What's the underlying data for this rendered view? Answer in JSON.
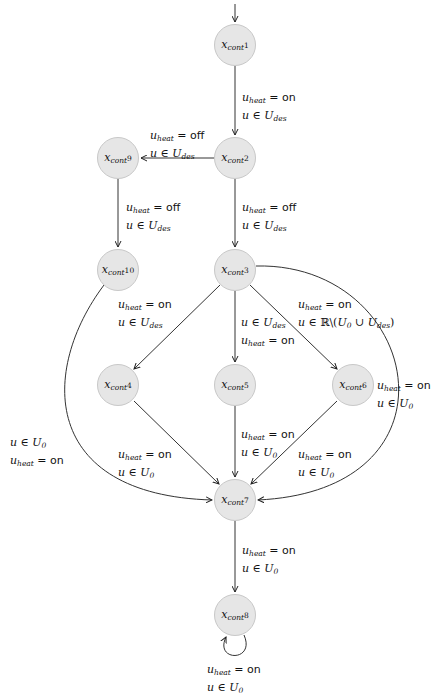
{
  "diagram": {
    "type": "state-transition-graph",
    "entry_arrow": "into x_cont 1",
    "nodes": [
      {
        "id": "x1",
        "var": "x",
        "sub": "cont",
        "index": "1",
        "cx": 235,
        "cy": 45
      },
      {
        "id": "x2",
        "var": "x",
        "sub": "cont",
        "index": "2",
        "cx": 235,
        "cy": 158
      },
      {
        "id": "x9",
        "var": "x",
        "sub": "cont",
        "index": "9",
        "cx": 118,
        "cy": 158
      },
      {
        "id": "x10",
        "var": "x",
        "sub": "cont",
        "index": "10",
        "cx": 118,
        "cy": 270
      },
      {
        "id": "x3",
        "var": "x",
        "sub": "cont",
        "index": "3",
        "cx": 235,
        "cy": 270
      },
      {
        "id": "x4",
        "var": "x",
        "sub": "cont",
        "index": "4",
        "cx": 118,
        "cy": 385
      },
      {
        "id": "x5",
        "var": "x",
        "sub": "cont",
        "index": "5",
        "cx": 235,
        "cy": 385
      },
      {
        "id": "x6",
        "var": "x",
        "sub": "cont",
        "index": "6",
        "cx": 353,
        "cy": 385
      },
      {
        "id": "x7",
        "var": "x",
        "sub": "cont",
        "index": "7",
        "cx": 235,
        "cy": 500
      },
      {
        "id": "x8",
        "var": "x",
        "sub": "cont",
        "index": "8",
        "cx": 235,
        "cy": 615
      }
    ],
    "edges": [
      {
        "from": "x1",
        "to": "x2",
        "heat": "on",
        "set": "U_des"
      },
      {
        "from": "x2",
        "to": "x9",
        "heat": "off",
        "set": "U_des"
      },
      {
        "from": "x9",
        "to": "x10",
        "heat": "off",
        "set": "U_des"
      },
      {
        "from": "x2",
        "to": "x3",
        "heat": "off",
        "set": "U_des"
      },
      {
        "from": "x10",
        "to": "x7",
        "heat": "on",
        "set": "U_des"
      },
      {
        "from": "x3",
        "to": "x4",
        "heat": "",
        "set": ""
      },
      {
        "from": "x3",
        "to": "x5",
        "heat": "on",
        "set": "U_des"
      },
      {
        "from": "x3",
        "to": "x6",
        "heat": "on",
        "set": "R\\(U_0 ∪ U_des)"
      },
      {
        "from": "x3",
        "to": "x7",
        "heat": "on",
        "set": "U_0"
      },
      {
        "from": "x4",
        "to": "x7",
        "heat": "on",
        "set": "U_0"
      },
      {
        "from": "x5",
        "to": "x7",
        "heat": "on",
        "set": "U_0"
      },
      {
        "from": "x6",
        "to": "x7",
        "heat": "on",
        "set": "U_0"
      },
      {
        "from": "x7",
        "to": "x8",
        "heat": "on",
        "set": "U_0"
      },
      {
        "from": "x8",
        "to": "x8",
        "heat": "on",
        "set": "U_0"
      }
    ]
  },
  "labels": {
    "u_heat": "u",
    "heat_sub": "heat",
    "eq": " = ",
    "on": "on",
    "off": "off",
    "u": "u",
    "in": " ∈ ",
    "U": "U",
    "des": "des",
    "zero": "0",
    "R_minus": "ℝ\\(",
    "cup": " ∪ ",
    "close": ")"
  }
}
